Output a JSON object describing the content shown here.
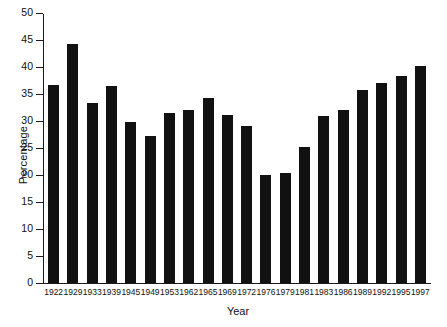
{
  "chart_data": {
    "type": "bar",
    "title": "",
    "xlabel": "Year",
    "ylabel": "Percentage",
    "categories": [
      "1922",
      "1929",
      "1933",
      "1939",
      "1945",
      "1949",
      "1953",
      "1962",
      "1965",
      "1969",
      "1972",
      "1976",
      "1979",
      "1981",
      "1983",
      "1986",
      "1989",
      "1992",
      "1995",
      "1997"
    ],
    "values": [
      36.7,
      44.3,
      33.3,
      36.5,
      29.8,
      27.3,
      31.5,
      32.0,
      34.3,
      31.2,
      29.0,
      20.0,
      20.4,
      25.2,
      31.0,
      32.1,
      35.8,
      37.1,
      38.4,
      40.1
    ],
    "ylim": [
      0,
      50
    ],
    "ytick_labels": [
      "0",
      "5",
      "10",
      "15",
      "20",
      "25",
      "30",
      "35",
      "40",
      "45",
      "50"
    ],
    "ytick_values": [
      0,
      5,
      10,
      15,
      20,
      25,
      30,
      35,
      40,
      45,
      50
    ],
    "grid": false,
    "legend": false,
    "legend_position": "none",
    "bar_color": "#111111",
    "axis_color": "#1a1a1a",
    "background_color": "#ffffff"
  }
}
